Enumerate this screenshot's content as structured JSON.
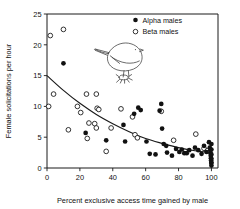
{
  "chart_data": {
    "type": "scatter",
    "title": "",
    "xlabel": "Percent exclusive access time gained by male",
    "ylabel": "Female solicitations per hour",
    "xlim": [
      0,
      104
    ],
    "ylim": [
      0,
      25
    ],
    "xticks": [
      0,
      20,
      40,
      60,
      80,
      100
    ],
    "yticks": [
      0,
      5,
      10,
      15,
      20,
      25
    ],
    "xtick_labels": [
      "0",
      "20",
      "40",
      "60",
      "80",
      "100"
    ],
    "ytick_labels": [
      "0",
      "5",
      "10",
      "15",
      "20",
      "25"
    ],
    "grid": false,
    "legend_position": "top-right",
    "legend": [
      {
        "name": "Alpha males",
        "marker": "filled-circle",
        "color": "#111111"
      },
      {
        "name": "Beta males",
        "marker": "open-circle",
        "color": "#111111"
      }
    ],
    "annotations": [
      {
        "name": "bird-illustration",
        "description": "line drawing of a perched songbird facing right"
      }
    ],
    "series": [
      {
        "name": "Alpha males",
        "marker": "filled-circle",
        "points": [
          [
            10.0,
            17.0
          ],
          [
            23.5,
            5.7
          ],
          [
            36.0,
            4.5
          ],
          [
            46.5,
            7.0
          ],
          [
            47.5,
            4.3
          ],
          [
            53.0,
            8.8
          ],
          [
            55.5,
            9.8
          ],
          [
            57.0,
            9.4
          ],
          [
            60.5,
            4.3
          ],
          [
            62.5,
            2.3
          ],
          [
            66.0,
            2.2
          ],
          [
            68.5,
            9.3
          ],
          [
            69.5,
            10.4
          ],
          [
            70.0,
            6.4
          ],
          [
            71.0,
            3.9
          ],
          [
            72.5,
            3.6
          ],
          [
            73.0,
            2.5
          ],
          [
            76.0,
            2.0
          ],
          [
            78.5,
            3.1
          ],
          [
            80.5,
            2.6
          ],
          [
            82.0,
            3.0
          ],
          [
            83.5,
            2.4
          ],
          [
            85.0,
            2.4
          ],
          [
            86.5,
            2.9
          ],
          [
            88.5,
            2.0
          ],
          [
            90.0,
            3.3
          ],
          [
            92.0,
            2.9
          ],
          [
            94.0,
            2.3
          ],
          [
            95.5,
            3.6
          ],
          [
            97.0,
            2.6
          ],
          [
            98.5,
            4.2
          ],
          [
            99.0,
            3.3
          ],
          [
            99.3,
            2.9
          ],
          [
            99.5,
            2.4
          ],
          [
            99.6,
            2.0
          ],
          [
            99.7,
            1.6
          ],
          [
            99.8,
            1.2
          ],
          [
            99.9,
            0.8
          ],
          [
            100.0,
            3.9
          ],
          [
            100.0,
            3.0
          ],
          [
            100.0,
            2.2
          ],
          [
            100.0,
            1.5
          ],
          [
            100.0,
            0.9
          ],
          [
            100.0,
            0.4
          ]
        ]
      },
      {
        "name": "Beta males",
        "marker": "open-circle",
        "points": [
          [
            2.0,
            21.5
          ],
          [
            10.0,
            22.5
          ],
          [
            4.0,
            12.0
          ],
          [
            1.0,
            10.0
          ],
          [
            13.0,
            6.2
          ],
          [
            18.5,
            10.0
          ],
          [
            20.5,
            9.0
          ],
          [
            24.0,
            12.0
          ],
          [
            24.5,
            4.8
          ],
          [
            25.5,
            7.3
          ],
          [
            29.0,
            7.2
          ],
          [
            30.0,
            12.0
          ],
          [
            30.5,
            9.7
          ],
          [
            31.5,
            9.5
          ],
          [
            30.0,
            6.5
          ],
          [
            36.0,
            2.7
          ],
          [
            39.0,
            6.5
          ],
          [
            45.0,
            9.6
          ],
          [
            52.0,
            8.3
          ],
          [
            53.5,
            5.4
          ],
          [
            55.0,
            4.9
          ],
          [
            69.5,
            9.2
          ],
          [
            77.0,
            4.5
          ],
          [
            90.5,
            5.5
          ],
          [
            95.5,
            3.2
          ],
          [
            97.5,
            2.8
          ]
        ]
      }
    ],
    "trend_curve": {
      "name": "fitted decline curve",
      "description": "smooth monotonically decreasing curve from about 15 at x=0 to about 2.5 at x=100",
      "points": [
        [
          0,
          15.0
        ],
        [
          10,
          12.6
        ],
        [
          20,
          10.5
        ],
        [
          30,
          8.7
        ],
        [
          40,
          7.2
        ],
        [
          50,
          5.9
        ],
        [
          60,
          4.8
        ],
        [
          70,
          4.0
        ],
        [
          80,
          3.3
        ],
        [
          90,
          2.8
        ],
        [
          100,
          2.5
        ]
      ]
    }
  }
}
